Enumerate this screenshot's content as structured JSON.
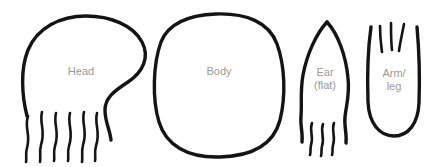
{
  "canvas": {
    "width": 433,
    "height": 167,
    "background": "#ffffff",
    "stroke_color": "#141414",
    "label_color": "#9a9a9a"
  },
  "shapes": [
    {
      "id": "head",
      "label": "Head",
      "label_lines": [
        "Head"
      ],
      "description": "open rounded blob with s-curve on right side and six wavy fringe strokes below",
      "fringe_count": 6
    },
    {
      "id": "body",
      "label": "Body",
      "label_lines": [
        "Body"
      ],
      "description": "closed rounded rectangle / egg outline",
      "fringe_count": 0
    },
    {
      "id": "ear",
      "label": "Ear (flat)",
      "label_lines": [
        "Ear",
        "(flat)"
      ],
      "description": "pointed leaf shape open at base with three short fringe strokes",
      "fringe_count": 3
    },
    {
      "id": "arm-leg",
      "label": "Arm/ leg",
      "label_lines": [
        "Arm/",
        "leg"
      ],
      "description": "u-shaped tube rounded at bottom open at top with three splayed fringe strokes",
      "fringe_count": 3
    }
  ]
}
